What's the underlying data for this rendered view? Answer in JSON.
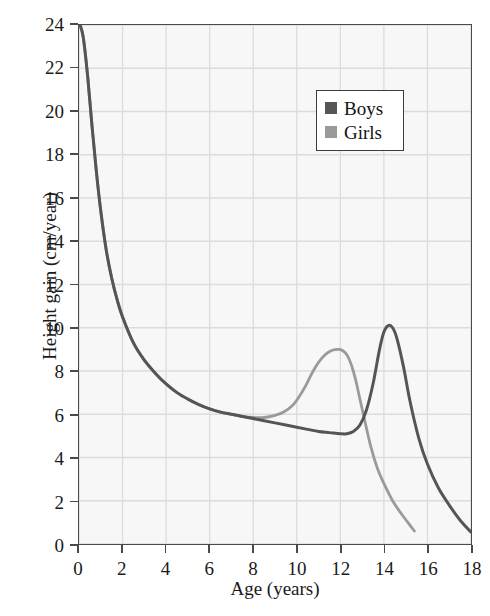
{
  "chart_data": {
    "type": "line",
    "title": "",
    "xlabel": "Age (years)",
    "ylabel": "Height gain (cm/year)",
    "xlim": [
      0,
      18
    ],
    "ylim": [
      0,
      24
    ],
    "xticks": [
      0,
      2,
      4,
      6,
      8,
      10,
      12,
      14,
      16,
      18
    ],
    "yticks": [
      0,
      2,
      4,
      6,
      8,
      10,
      12,
      14,
      16,
      18,
      20,
      22,
      24
    ],
    "xtick_labels": [
      "0",
      "2",
      "4",
      "6",
      "8",
      "10",
      "12",
      "14",
      "16",
      "18"
    ],
    "ytick_labels": [
      "0",
      "2",
      "4",
      "6",
      "8",
      "10",
      "12",
      "14",
      "16",
      "18",
      "20",
      "22",
      "24"
    ],
    "grid": true,
    "legend_position": "upper right",
    "legend_entries": [
      {
        "label": "Boys",
        "color": "#555555"
      },
      {
        "label": "Girls",
        "color": "#9a9a9a"
      }
    ],
    "series": [
      {
        "name": "Boys",
        "color": "#555555",
        "x": [
          0.05,
          0.2,
          0.4,
          0.6,
          0.8,
          1.0,
          1.25,
          1.5,
          1.75,
          2.0,
          2.5,
          3.0,
          3.5,
          4.0,
          4.5,
          5.0,
          5.5,
          6.0,
          6.5,
          7.0,
          7.5,
          8.0,
          8.5,
          9.0,
          9.5,
          10.0,
          10.5,
          11.0,
          11.5,
          12.0,
          12.3,
          12.6,
          12.9,
          13.2,
          13.5,
          13.8,
          14.0,
          14.2,
          14.4,
          14.6,
          14.9,
          15.2,
          15.6,
          16.0,
          16.5,
          17.0,
          17.5,
          18.0
        ],
        "y": [
          24.0,
          23.4,
          21.6,
          19.3,
          17.2,
          15.4,
          13.6,
          12.3,
          11.3,
          10.5,
          9.3,
          8.5,
          7.9,
          7.4,
          7.0,
          6.7,
          6.45,
          6.25,
          6.1,
          6.0,
          5.9,
          5.8,
          5.7,
          5.6,
          5.5,
          5.4,
          5.3,
          5.2,
          5.15,
          5.1,
          5.1,
          5.2,
          5.5,
          6.2,
          7.4,
          9.0,
          9.8,
          10.1,
          10.0,
          9.5,
          8.2,
          6.6,
          4.9,
          3.7,
          2.6,
          1.8,
          1.1,
          0.55
        ]
      },
      {
        "name": "Girls",
        "color": "#9a9a9a",
        "x": [
          0.05,
          0.2,
          0.4,
          0.6,
          0.8,
          1.0,
          1.25,
          1.5,
          1.75,
          2.0,
          2.5,
          3.0,
          3.5,
          4.0,
          4.5,
          5.0,
          5.5,
          6.0,
          6.5,
          7.0,
          7.5,
          8.0,
          8.5,
          9.0,
          9.4,
          9.8,
          10.1,
          10.4,
          10.7,
          11.0,
          11.3,
          11.6,
          11.9,
          12.1,
          12.3,
          12.5,
          12.7,
          12.9,
          13.1,
          13.4,
          13.7,
          14.0,
          14.4,
          14.8,
          15.1,
          15.4
        ],
        "y": [
          24.0,
          23.4,
          21.6,
          19.3,
          17.2,
          15.4,
          13.6,
          12.3,
          11.3,
          10.5,
          9.3,
          8.5,
          7.9,
          7.4,
          7.0,
          6.7,
          6.45,
          6.25,
          6.1,
          6.0,
          5.9,
          5.85,
          5.85,
          5.95,
          6.1,
          6.4,
          6.8,
          7.3,
          7.9,
          8.4,
          8.75,
          8.95,
          9.0,
          8.95,
          8.75,
          8.3,
          7.6,
          6.7,
          5.8,
          4.5,
          3.5,
          2.8,
          2.0,
          1.4,
          1.0,
          0.6
        ]
      }
    ]
  },
  "axes": {
    "x_title": "Age (years)",
    "y_title": "Height gain (cm/year)"
  },
  "legend": {
    "boys_label": "Boys",
    "girls_label": "Girls"
  },
  "colors": {
    "boys": "#555555",
    "girls": "#9a9a9a",
    "grid": "#dcdcdc",
    "plot_background": "#f7f7f7",
    "axis": "#4a4a4a",
    "text": "#1a1a1a"
  }
}
